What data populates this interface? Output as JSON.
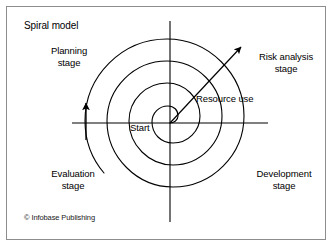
{
  "diagram": {
    "title": "Spiral model",
    "credit": "© Infobase Publishing",
    "center_label": "Start",
    "axis_label": "Resource use",
    "stages": [
      {
        "name": "planning",
        "label": "Planning\nstage"
      },
      {
        "name": "risk-analysis",
        "label": "Risk analysis\nstage"
      },
      {
        "name": "development",
        "label": "Development\nstage"
      },
      {
        "name": "evaluation",
        "label": "Evaluation\nstage"
      }
    ],
    "colors": {
      "line": "#000000",
      "frame": "#8d8d8d",
      "background": "#ffffff",
      "text": "#000000"
    },
    "geometry": {
      "center_x": 170,
      "center_y": 123,
      "turns": 3,
      "axis_horizontal": [
        72,
        268
      ],
      "axis_vertical": [
        21,
        222
      ],
      "spiral_right_crossings": [
        219,
        238,
        257
      ],
      "spiral_left_crossings": [
        98,
        116,
        133
      ],
      "spiral_top_crossings": [
        27,
        48,
        68
      ],
      "resource_arrow_tip": [
        243,
        45
      ],
      "spiral_arrow_tip": [
        86,
        100
      ]
    }
  }
}
